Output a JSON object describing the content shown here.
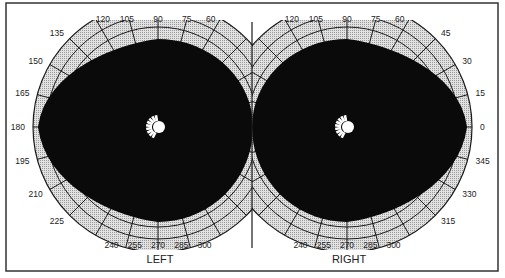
{
  "diagram": {
    "type": "binocular visual field chart",
    "colors": {
      "field": "#0a0a0a",
      "grid_fill": "#d4d4d4",
      "grid_line": "#1a1a1a",
      "frame": "#333333",
      "blind_spot": "#ffffff"
    },
    "left": {
      "label": "LEFT",
      "ticks": [
        {
          "deg": 120,
          "text": "120"
        },
        {
          "deg": 105,
          "text": "105"
        },
        {
          "deg": 90,
          "text": "90"
        },
        {
          "deg": 75,
          "text": "75"
        },
        {
          "deg": 60,
          "text": "60"
        },
        {
          "deg": 135,
          "text": "135"
        },
        {
          "deg": 150,
          "text": "150"
        },
        {
          "deg": 165,
          "text": "165"
        },
        {
          "deg": 180,
          "text": "180"
        },
        {
          "deg": 195,
          "text": "195"
        },
        {
          "deg": 210,
          "text": "210"
        },
        {
          "deg": 225,
          "text": "225"
        },
        {
          "deg": 240,
          "text": "240"
        },
        {
          "deg": 255,
          "text": "255"
        },
        {
          "deg": 270,
          "text": "270"
        },
        {
          "deg": 285,
          "text": "285"
        },
        {
          "deg": 300,
          "text": "300"
        }
      ]
    },
    "right": {
      "label": "RIGHT",
      "ticks": [
        {
          "deg": 120,
          "text": "120"
        },
        {
          "deg": 105,
          "text": "105"
        },
        {
          "deg": 90,
          "text": "90"
        },
        {
          "deg": 75,
          "text": "75"
        },
        {
          "deg": 60,
          "text": "60"
        },
        {
          "deg": 45,
          "text": "45"
        },
        {
          "deg": 30,
          "text": "30"
        },
        {
          "deg": 15,
          "text": "15"
        },
        {
          "deg": 0,
          "text": "0"
        },
        {
          "deg": 345,
          "text": "345"
        },
        {
          "deg": 330,
          "text": "330"
        },
        {
          "deg": 315,
          "text": "315"
        },
        {
          "deg": 240,
          "text": "240"
        },
        {
          "deg": 255,
          "text": "255"
        },
        {
          "deg": 270,
          "text": "270"
        },
        {
          "deg": 285,
          "text": "285"
        },
        {
          "deg": 300,
          "text": "300"
        }
      ]
    }
  }
}
